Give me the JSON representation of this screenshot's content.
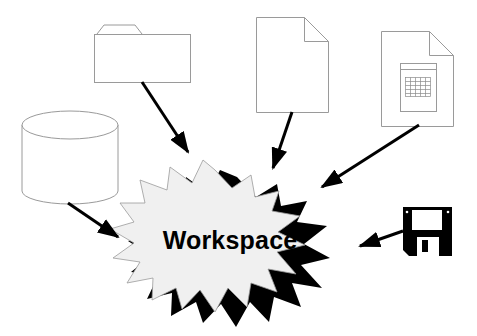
{
  "diagram": {
    "center_label": "Workspace",
    "nodes": [
      {
        "id": "folder",
        "icon": "folder-icon"
      },
      {
        "id": "database",
        "icon": "database-cylinder-icon"
      },
      {
        "id": "document",
        "icon": "document-icon"
      },
      {
        "id": "spreadsheet",
        "icon": "spreadsheet-document-icon"
      },
      {
        "id": "floppy",
        "icon": "floppy-disk-icon"
      }
    ],
    "edges": [
      {
        "from": "folder",
        "to": "workspace"
      },
      {
        "from": "database",
        "to": "workspace"
      },
      {
        "from": "document",
        "to": "workspace"
      },
      {
        "from": "spreadsheet",
        "to": "workspace"
      },
      {
        "from": "floppy",
        "to": "workspace"
      }
    ],
    "colors": {
      "outline": "#9a9a9a",
      "burst_fill": "#f0f0f0",
      "shadow": "#000000",
      "arrow": "#000000"
    }
  }
}
